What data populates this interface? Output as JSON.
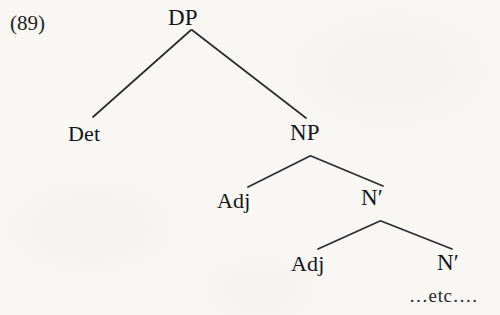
{
  "figure": {
    "example_number": "(89)",
    "type": "syntax-tree"
  },
  "tree": {
    "nodes": [
      {
        "id": "dp",
        "label": "DP",
        "x": 192,
        "y": 18
      },
      {
        "id": "det",
        "label": "Det",
        "x": 92,
        "y": 134
      },
      {
        "id": "np",
        "label": "NP",
        "x": 312,
        "y": 133
      },
      {
        "id": "adj1",
        "label": "Adj",
        "x": 240,
        "y": 201
      },
      {
        "id": "nbar1",
        "label": "N′",
        "x": 380,
        "y": 198
      },
      {
        "id": "adj2",
        "label": "Adj",
        "x": 314,
        "y": 264
      },
      {
        "id": "nbar2",
        "label": "N′",
        "x": 455,
        "y": 263
      }
    ],
    "edges": [
      {
        "from": "dp",
        "to": "det",
        "x1": 191,
        "y1": 30,
        "x2": 93,
        "y2": 117
      },
      {
        "from": "dp",
        "to": "np",
        "x1": 192,
        "y1": 30,
        "x2": 306,
        "y2": 118
      },
      {
        "from": "np",
        "to": "adj1",
        "x1": 310,
        "y1": 156,
        "x2": 248,
        "y2": 187
      },
      {
        "from": "np",
        "to": "nbar1",
        "x1": 311,
        "y1": 156,
        "x2": 383,
        "y2": 186
      },
      {
        "from": "nbar1",
        "to": "adj2",
        "x1": 380,
        "y1": 221,
        "x2": 318,
        "y2": 249
      },
      {
        "from": "nbar1",
        "to": "nbar2",
        "x1": 381,
        "y1": 221,
        "x2": 452,
        "y2": 249
      }
    ],
    "continuation_label": "…etc…."
  },
  "style": {
    "background": "#f8f7f4",
    "ink": "#15161a",
    "line_color": "#2b2c30",
    "line_width": 1.7
  }
}
